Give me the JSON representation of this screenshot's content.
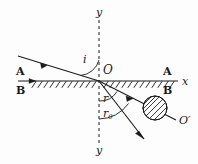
{
  "figure": {
    "kind": "optics-refraction-diagram",
    "background_color": "#fdfdfd",
    "stroke_color": "#1a1a1a",
    "axes": {
      "x_label": "x",
      "y_label_top": "y",
      "y_label_bottom": "y",
      "origin_label": "O"
    },
    "media": {
      "upper_left": "A",
      "lower_left": "B",
      "upper_right": "A",
      "lower_right": "B"
    },
    "angles": {
      "incidence": "i",
      "refraction": "r",
      "refraction_critical": "r",
      "refraction_critical_subscript": "0"
    },
    "points": {
      "image_point": "O′"
    },
    "elements": {
      "interface_hatching": "hatched-boundary",
      "ray_circle": "hatched-circle-marker",
      "incident_ray": "incident-ray",
      "refracted_ray_to_o_prime": "refracted-ray",
      "second_refracted_ray": "second-refracted-ray",
      "normal_axis": "dashed-normal"
    }
  }
}
